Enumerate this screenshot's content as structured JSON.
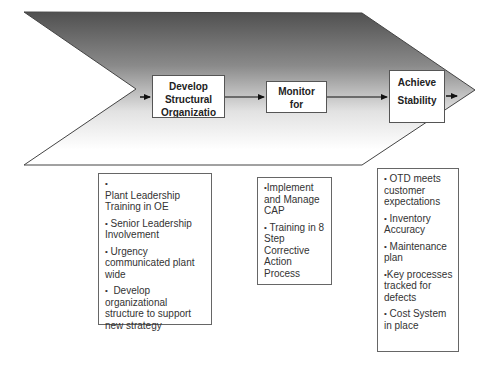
{
  "diagram": {
    "type": "process-chevron",
    "colors": {
      "chevron_gradient_top": "#555555",
      "chevron_gradient_bottom": "#ffffff",
      "outline": "#444444",
      "box_fill": "#ffffff"
    },
    "steps": [
      {
        "lines": [
          "Develop",
          "Structural",
          "Organizatio"
        ]
      },
      {
        "lines": [
          "Monitor",
          "for"
        ]
      },
      {
        "lines": [
          "Achieve",
          "Stability"
        ]
      }
    ],
    "details": [
      {
        "items": [
          "Plant Leadership Training in OE",
          "Senior Leadership Involvement",
          "Urgency communicated plant wide",
          "Develop organizational structure to support new strategy"
        ]
      },
      {
        "items": [
          "Implement and Manage CAP",
          "Training in 8 Step Corrective Action Process"
        ]
      },
      {
        "items": [
          "OTD meets customer expectations",
          "Inventory Accuracy",
          "Maintenance plan",
          "Key processes tracked for defects",
          "Cost System in place"
        ]
      }
    ],
    "bullet_glyph": "•"
  }
}
